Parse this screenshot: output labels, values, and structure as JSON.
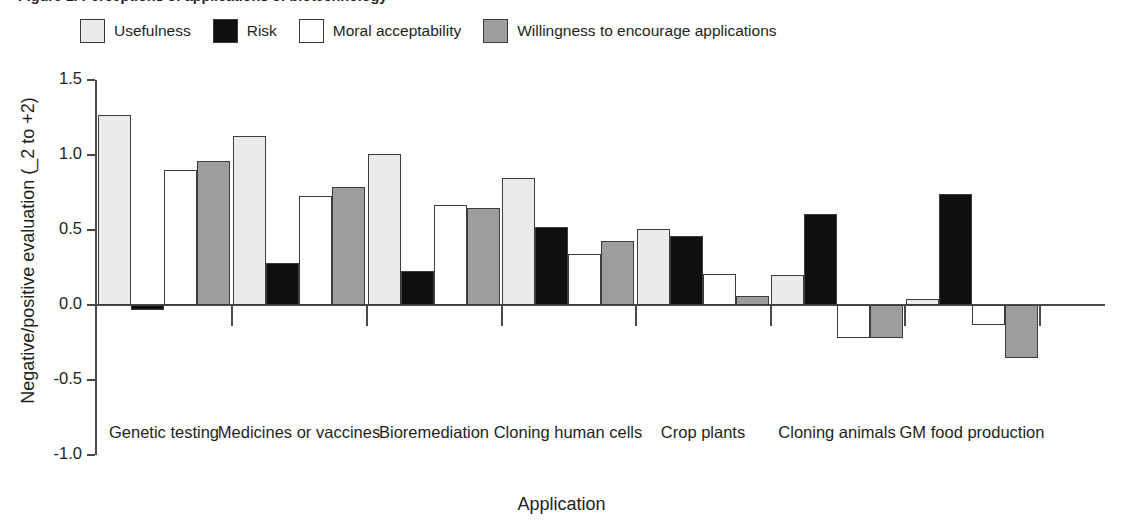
{
  "figure": {
    "title": "Figure 1. Perceptions of applications of biotechnology",
    "xaxis_title": "Application",
    "yaxis_title": "Negative/positive evaluation (_2 to +2)"
  },
  "legend": {
    "items": [
      {
        "label": "Usefulness",
        "color": "#ebebeb"
      },
      {
        "label": "Risk",
        "color": "#100f0f"
      },
      {
        "label": "Moral acceptability",
        "color": "#ffffff"
      },
      {
        "label": "Willingness to encourage applications",
        "color": "#9d9d9d"
      }
    ]
  },
  "chart_data": {
    "type": "bar",
    "title": "Figure 1. Perceptions of applications of biotechnology",
    "xlabel": "Application",
    "ylabel": "Negative/positive evaluation (_2 to +2)",
    "ylim": [
      -1.0,
      1.5
    ],
    "yticks": [
      "1.5",
      "1.0",
      "0.5",
      "0.0",
      "-0.5",
      "-1.0"
    ],
    "ytick_values": [
      1.5,
      1.0,
      0.5,
      0.0,
      -0.5,
      -1.0
    ],
    "grid": false,
    "legend_position": "top-left",
    "categories": [
      "Genetic testing",
      "Medicines or vaccines",
      "Bioremediation",
      "Cloning human cells",
      "Crop plants",
      "Cloning animals",
      "GM food production"
    ],
    "series": [
      {
        "name": "Usefulness",
        "color": "#ebebeb",
        "values": [
          1.27,
          1.13,
          1.01,
          0.85,
          0.51,
          0.2,
          0.04
        ]
      },
      {
        "name": "Risk",
        "color": "#100f0f",
        "values": [
          -0.03,
          0.28,
          0.23,
          0.52,
          0.46,
          0.61,
          0.74
        ]
      },
      {
        "name": "Moral acceptability",
        "color": "#ffffff",
        "values": [
          0.9,
          0.73,
          0.67,
          0.34,
          0.21,
          -0.22,
          -0.13
        ]
      },
      {
        "name": "Willingness to encourage applications",
        "color": "#9d9d9d",
        "values": [
          0.96,
          0.79,
          0.65,
          0.43,
          0.06,
          -0.22,
          -0.35
        ]
      }
    ]
  }
}
